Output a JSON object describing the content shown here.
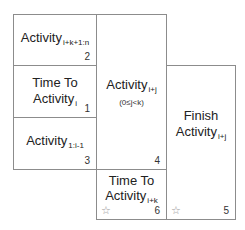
{
  "cells": [
    {
      "id": "2",
      "line1": "",
      "main": "Activity",
      "sub": "i+k+1:n",
      "number": "2",
      "star": false
    },
    {
      "id": "1",
      "line1": "Time To",
      "main": "Activity",
      "sub": "i",
      "number": "1",
      "star": false
    },
    {
      "id": "3",
      "line1": "",
      "main": "Activity",
      "sub": "1:i-1",
      "number": "3",
      "star": false
    },
    {
      "id": "4",
      "line1": "",
      "main": "Activity",
      "sub": "i+j",
      "note": "(0≤j<k)",
      "number": "4",
      "star": false
    },
    {
      "id": "6",
      "line1": "Time To",
      "main": "Activity",
      "sub": "i+k",
      "number": "6",
      "star": true
    },
    {
      "id": "5",
      "line1": "Finish",
      "main": "Activity",
      "sub": "i+j",
      "number": "5",
      "star": true
    }
  ],
  "star_glyph": "☆",
  "colors": {
    "border": "#8c8c8c",
    "text": "#222222",
    "star": "#999999"
  }
}
